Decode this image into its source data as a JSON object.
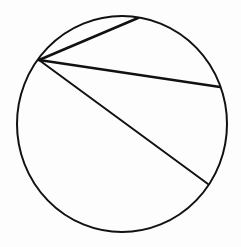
{
  "diagram": {
    "type": "circle-with-chords",
    "background": "#fdfdfd",
    "stroke_color": "#111111",
    "circle": {
      "cx": 122,
      "cy": 124,
      "rx": 105,
      "ry": 108,
      "stroke_width": 2
    },
    "common_vertex": {
      "x": 39,
      "y": 60
    },
    "chords": [
      {
        "name": "chord-top",
        "x1": 39,
        "y1": 60,
        "x2": 138,
        "y2": 18,
        "stroke_width": 2.5
      },
      {
        "name": "chord-right",
        "x1": 39,
        "y1": 60,
        "x2": 220,
        "y2": 87,
        "stroke_width": 2.5
      },
      {
        "name": "chord-lower",
        "x1": 39,
        "y1": 60,
        "x2": 208,
        "y2": 184,
        "stroke_width": 2
      }
    ]
  }
}
